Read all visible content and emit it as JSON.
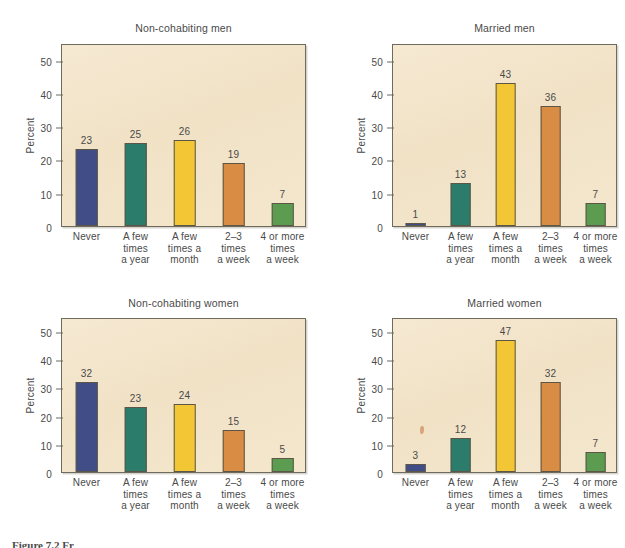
{
  "figure": {
    "caption": "Figure 7.2 Fr",
    "axis_label": "Percent",
    "categories": [
      "Never",
      "A few\ntimes\na year",
      "A few\ntimes a\nmonth",
      "2–3\ntimes\na week",
      "4 or more\ntimes\na week"
    ],
    "y_ticks": [
      "0",
      "10",
      "20",
      "30",
      "40",
      "50"
    ],
    "y_min": 0,
    "y_max": 55,
    "bar_colors": [
      "#414d86",
      "#2c7c6b",
      "#f2c634",
      "#d98c43",
      "#5c9c50"
    ],
    "plot_background": "#f2e4c9",
    "page_background": "#ffffff"
  },
  "chart_data": [
    {
      "type": "bar",
      "title": "Non-cohabiting men",
      "xlabel": "",
      "ylabel": "Percent",
      "ylim": [
        0,
        55
      ],
      "yticks": [
        0,
        10,
        20,
        30,
        40,
        50
      ],
      "grid": false,
      "legend": "none",
      "categories": [
        "Never",
        "A few times a year",
        "A few times a month",
        "2–3 times a week",
        "4 or more times a week"
      ],
      "values": [
        23,
        25,
        26,
        19,
        7
      ]
    },
    {
      "type": "bar",
      "title": "Married men",
      "xlabel": "",
      "ylabel": "Percent",
      "ylim": [
        0,
        55
      ],
      "yticks": [
        0,
        10,
        20,
        30,
        40,
        50
      ],
      "grid": false,
      "legend": "none",
      "categories": [
        "Never",
        "A few times a year",
        "A few times a month",
        "2–3 times a week",
        "4 or more times a week"
      ],
      "values": [
        1,
        13,
        43,
        36,
        7
      ]
    },
    {
      "type": "bar",
      "title": "Non-cohabiting women",
      "xlabel": "",
      "ylabel": "Percent",
      "ylim": [
        0,
        55
      ],
      "yticks": [
        0,
        10,
        20,
        30,
        40,
        50
      ],
      "grid": false,
      "legend": "none",
      "categories": [
        "Never",
        "A few times a year",
        "A few times a month",
        "2–3 times a week",
        "4 or more times a week"
      ],
      "values": [
        32,
        23,
        24,
        15,
        5
      ]
    },
    {
      "type": "bar",
      "title": "Married women",
      "xlabel": "",
      "ylabel": "Percent",
      "ylim": [
        0,
        55
      ],
      "yticks": [
        0,
        10,
        20,
        30,
        40,
        50
      ],
      "grid": false,
      "legend": "none",
      "categories": [
        "Never",
        "A few times a year",
        "A few times a month",
        "2–3 times a week",
        "4 or more times a week"
      ],
      "values": [
        3,
        12,
        47,
        32,
        7
      ]
    }
  ],
  "panels": [
    {
      "title": "Non-cohabiting men",
      "values": [
        23,
        25,
        26,
        19,
        7
      ]
    },
    {
      "title": "Married men",
      "values": [
        1,
        13,
        43,
        36,
        7
      ]
    },
    {
      "title": "Non-cohabiting women",
      "values": [
        32,
        23,
        24,
        15,
        5
      ]
    },
    {
      "title": "Married women",
      "values": [
        3,
        12,
        47,
        32,
        7
      ]
    }
  ]
}
